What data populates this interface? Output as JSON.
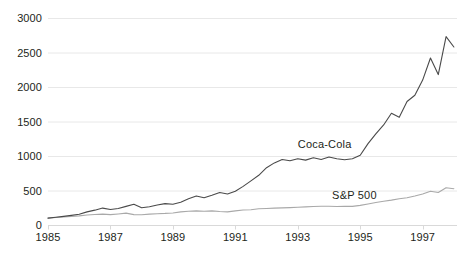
{
  "chart_data": {
    "type": "line",
    "title": "",
    "subtitle": "",
    "xlabel": "",
    "ylabel": "",
    "grid": "horizontal",
    "legend_position": "inline-annotation",
    "xlim": [
      1985,
      1998.1
    ],
    "ylim": [
      0,
      3000
    ],
    "yticks": [
      0,
      500,
      1000,
      1500,
      2000,
      2500,
      3000
    ],
    "ytick_labels": [
      "0",
      "500",
      "1000",
      "1500",
      "2000",
      "2500",
      "3000"
    ],
    "xticks": [
      1985,
      1987,
      1989,
      1991,
      1993,
      1995,
      1997
    ],
    "xtick_labels": [
      "1985",
      "1987",
      "1989",
      "1991",
      "1993",
      "1995",
      "1997"
    ],
    "annotations": [
      {
        "text": "Coca-Cola",
        "x": 1993.0,
        "y": 1180
      },
      {
        "text": "S&P 500",
        "x": 1994.1,
        "y": 440
      }
    ],
    "colors": {
      "coca_cola": "#4a4a4a",
      "sp500": "#a9a9a9",
      "gridline": "#e8e8e8",
      "axis": "#d9d9d9",
      "text": "#231f20",
      "background": "#ffffff"
    },
    "series": [
      {
        "name": "Coca-Cola",
        "color": "#4a4a4a",
        "x": [
          1985.0,
          1985.25,
          1985.5,
          1985.75,
          1986.0,
          1986.25,
          1986.5,
          1986.75,
          1987.0,
          1987.25,
          1987.5,
          1987.75,
          1988.0,
          1988.25,
          1988.5,
          1988.75,
          1989.0,
          1989.25,
          1989.5,
          1989.75,
          1990.0,
          1990.25,
          1990.5,
          1990.75,
          1991.0,
          1991.25,
          1991.5,
          1991.75,
          1992.0,
          1992.25,
          1992.5,
          1992.75,
          1993.0,
          1993.25,
          1993.5,
          1993.75,
          1994.0,
          1994.25,
          1994.5,
          1994.75,
          1995.0,
          1995.25,
          1995.5,
          1995.75,
          1996.0,
          1996.25,
          1996.5,
          1996.75,
          1997.0,
          1997.25,
          1997.5,
          1997.75,
          1998.0
        ],
        "values": [
          100,
          112,
          125,
          140,
          155,
          190,
          215,
          245,
          225,
          240,
          270,
          300,
          250,
          265,
          290,
          310,
          300,
          330,
          380,
          420,
          395,
          430,
          470,
          450,
          490,
          560,
          640,
          720,
          830,
          900,
          950,
          930,
          960,
          940,
          975,
          950,
          985,
          960,
          945,
          960,
          1010,
          1180,
          1320,
          1450,
          1620,
          1560,
          1790,
          1880,
          2100,
          2420,
          2180,
          2730,
          2580
        ]
      },
      {
        "name": "S&P 500",
        "color": "#a9a9a9",
        "x": [
          1985.0,
          1985.25,
          1985.5,
          1985.75,
          1986.0,
          1986.25,
          1986.5,
          1986.75,
          1987.0,
          1987.25,
          1987.5,
          1987.75,
          1988.0,
          1988.25,
          1988.5,
          1988.75,
          1989.0,
          1989.25,
          1989.5,
          1989.75,
          1990.0,
          1990.25,
          1990.5,
          1990.75,
          1991.0,
          1991.25,
          1991.5,
          1991.75,
          1992.0,
          1992.25,
          1992.5,
          1992.75,
          1993.0,
          1993.25,
          1993.5,
          1993.75,
          1994.0,
          1994.25,
          1994.5,
          1994.75,
          1995.0,
          1995.25,
          1995.5,
          1995.75,
          1996.0,
          1996.25,
          1996.5,
          1996.75,
          1997.0,
          1997.25,
          1997.5,
          1997.75,
          1998.0
        ],
        "values": [
          100,
          108,
          116,
          124,
          132,
          145,
          152,
          158,
          150,
          160,
          172,
          150,
          148,
          158,
          164,
          168,
          175,
          190,
          200,
          205,
          200,
          205,
          196,
          190,
          205,
          218,
          222,
          235,
          240,
          245,
          248,
          252,
          258,
          262,
          268,
          272,
          272,
          268,
          272,
          270,
          285,
          305,
          325,
          345,
          360,
          380,
          395,
          420,
          450,
          490,
          470,
          540,
          525
        ]
      }
    ]
  },
  "layout": {
    "plot": {
      "left": 48,
      "right": 457,
      "top": 18,
      "bottom": 225
    }
  }
}
